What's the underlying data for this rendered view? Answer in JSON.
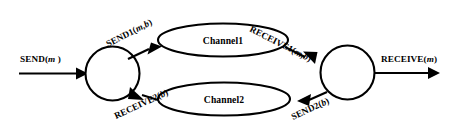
{
  "diagram": {
    "background_color": "#ffffff",
    "stroke_color": "#000000",
    "nodes": [
      {
        "id": "sender",
        "name": "sender-node",
        "shape": "circle",
        "label": ""
      },
      {
        "id": "receiver",
        "name": "receiver-node",
        "shape": "circle",
        "label": ""
      }
    ],
    "channels": [
      {
        "id": "channel1",
        "label": "Channel1",
        "shape": "ellipse"
      },
      {
        "id": "channel2",
        "label": "Channel2",
        "shape": "ellipse"
      }
    ],
    "edges": [
      {
        "id": "send",
        "name": "send-edge",
        "label_prefix": "SEND(",
        "label_var": "m",
        "label_suffix": " )",
        "label_full": "SEND(m )",
        "from": "external-in",
        "to": "sender",
        "rotation_deg": 0
      },
      {
        "id": "send1",
        "name": "send1-edge",
        "label_prefix": "SEND1(",
        "label_var": "m,b",
        "label_suffix": ")",
        "label_full": "SEND1(m,b)",
        "from": "sender",
        "to": "channel1",
        "rotation_deg": -27
      },
      {
        "id": "receive1",
        "name": "receive1-edge",
        "label_prefix": "RECEIVE1(",
        "label_var": "m,b",
        "label_suffix": ")",
        "label_full": "RECEIVE1(m,b)",
        "from": "channel1",
        "to": "receiver",
        "rotation_deg": 27
      },
      {
        "id": "receive",
        "name": "receive-edge",
        "label_prefix": "RECEIVE(",
        "label_var": "m",
        "label_suffix": ")",
        "label_full": "RECEIVE(m)",
        "from": "receiver",
        "to": "external-out",
        "rotation_deg": 0
      },
      {
        "id": "send2",
        "name": "send2-edge",
        "label_prefix": "SEND2(",
        "label_var": "b",
        "label_suffix": ")",
        "label_full": "SEND2(b)",
        "from": "receiver",
        "to": "channel2",
        "rotation_deg": -25
      },
      {
        "id": "receive2",
        "name": "receive2-edge",
        "label_prefix": "RECEIVE2(",
        "label_var": "b",
        "label_suffix": ")",
        "label_full": "RECEIVE2(b)",
        "from": "channel2",
        "to": "sender",
        "rotation_deg": 25
      }
    ]
  }
}
